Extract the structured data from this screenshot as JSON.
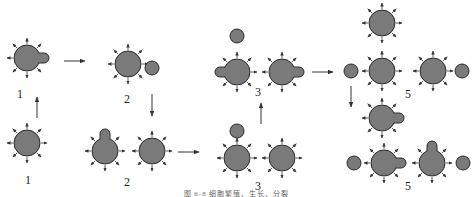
{
  "diagram": {
    "colors": {
      "cell_fill": "#7a7a7a",
      "cell_stroke": "#2a2a2a",
      "arrow": "#333333",
      "background": "#ffffff"
    },
    "stage_labels": [
      {
        "id": "label-1-top",
        "text": "1",
        "x": 20,
        "y": 94
      },
      {
        "id": "label-1-bottom",
        "text": "1",
        "x": 28,
        "y": 180
      },
      {
        "id": "label-2-top",
        "text": "2",
        "x": 127,
        "y": 99
      },
      {
        "id": "label-2-bottom",
        "text": "2",
        "x": 127,
        "y": 182
      },
      {
        "id": "label-3-top",
        "text": "3",
        "x": 258,
        "y": 92
      },
      {
        "id": "label-3-bottom",
        "text": "3",
        "x": 258,
        "y": 186
      },
      {
        "id": "label-5-top",
        "text": "5",
        "x": 408,
        "y": 94
      },
      {
        "id": "label-5-bottom",
        "text": "5",
        "x": 408,
        "y": 186
      }
    ],
    "cells": [
      {
        "id": "stage1-top-cell",
        "x": 27,
        "y": 58,
        "r": 13,
        "spikes": true,
        "bud": "right"
      },
      {
        "id": "stage1-bottom-cell",
        "x": 27,
        "y": 143,
        "r": 13,
        "spikes": true,
        "bud": "none"
      },
      {
        "id": "stage2-top-cell",
        "x": 128,
        "y": 64,
        "r": 13,
        "spikes": true,
        "bud": "none"
      },
      {
        "id": "stage2-top-daughter",
        "x": 152,
        "y": 68,
        "r": 7,
        "spikes": false,
        "bud": "none"
      },
      {
        "id": "stage2-bottom-left-cell",
        "x": 105,
        "y": 151,
        "r": 13,
        "spikes": true,
        "bud": "up"
      },
      {
        "id": "stage2-bottom-right-cell",
        "x": 152,
        "y": 151,
        "r": 13,
        "spikes": true,
        "bud": "none"
      },
      {
        "id": "stage3-bottom-left-cell",
        "x": 237,
        "y": 158,
        "r": 13,
        "spikes": true,
        "bud": "none"
      },
      {
        "id": "stage3-bottom-daughter",
        "x": 237,
        "y": 131,
        "r": 7,
        "spikes": false,
        "bud": "none"
      },
      {
        "id": "stage3-bottom-right-cell",
        "x": 282,
        "y": 158,
        "r": 13,
        "spikes": true,
        "bud": "none"
      },
      {
        "id": "stage3-top-daughter",
        "x": 237,
        "y": 36,
        "r": 7,
        "spikes": false,
        "bud": "none"
      },
      {
        "id": "stage3-top-left-cell",
        "x": 237,
        "y": 72,
        "r": 13,
        "spikes": true,
        "bud": "left"
      },
      {
        "id": "stage3-top-right-cell",
        "x": 282,
        "y": 72,
        "r": 13,
        "spikes": true,
        "bud": "right"
      },
      {
        "id": "stage5-top-cell",
        "x": 382,
        "y": 23,
        "r": 13,
        "spikes": true,
        "bud": "none"
      },
      {
        "id": "stage5-row1-left-daughter",
        "x": 351,
        "y": 71,
        "r": 7,
        "spikes": false,
        "bud": "none"
      },
      {
        "id": "stage5-row1-left-cell",
        "x": 382,
        "y": 71,
        "r": 13,
        "spikes": true,
        "bud": "none"
      },
      {
        "id": "stage5-row1-right-cell",
        "x": 433,
        "y": 71,
        "r": 13,
        "spikes": true,
        "bud": "none"
      },
      {
        "id": "stage5-row1-right-daughter",
        "x": 462,
        "y": 71,
        "r": 7,
        "spikes": false,
        "bud": "none"
      },
      {
        "id": "stage5-middle-cell",
        "x": 382,
        "y": 118,
        "r": 13,
        "spikes": true,
        "bud": "right"
      },
      {
        "id": "stage5-row2-left-daughter",
        "x": 354,
        "y": 163,
        "r": 7,
        "spikes": false,
        "bud": "none"
      },
      {
        "id": "stage5-row2-left-cell",
        "x": 384,
        "y": 163,
        "r": 13,
        "spikes": true,
        "bud": "right"
      },
      {
        "id": "stage5-row2-right-cell",
        "x": 432,
        "y": 163,
        "r": 13,
        "spikes": true,
        "bud": "up"
      },
      {
        "id": "stage5-row2-right-daughter",
        "x": 463,
        "y": 163,
        "r": 7,
        "spikes": false,
        "bud": "none"
      }
    ],
    "flow_arrows": [
      {
        "id": "arrow-1-bottom-to-top",
        "x1": 37,
        "y1": 118,
        "x2": 37,
        "y2": 97
      },
      {
        "id": "arrow-1-to-2",
        "x1": 64,
        "y1": 61,
        "x2": 85,
        "y2": 61
      },
      {
        "id": "arrow-2-top-to-bottom",
        "x1": 152,
        "y1": 94,
        "x2": 152,
        "y2": 116
      },
      {
        "id": "arrow-2-to-3",
        "x1": 178,
        "y1": 152,
        "x2": 199,
        "y2": 152
      },
      {
        "id": "arrow-3-bottom-to-top",
        "x1": 261,
        "y1": 124,
        "x2": 261,
        "y2": 103
      },
      {
        "id": "arrow-3-to-5",
        "x1": 312,
        "y1": 72,
        "x2": 333,
        "y2": 72
      },
      {
        "id": "arrow-5-down",
        "x1": 351,
        "y1": 86,
        "x2": 351,
        "y2": 107
      }
    ],
    "caption": "图 6-8   细胞繁殖、生长、分裂"
  }
}
